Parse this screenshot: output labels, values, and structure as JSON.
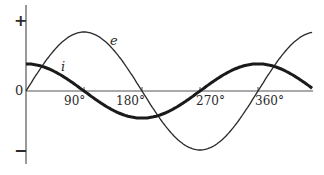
{
  "chart_data": {
    "type": "line",
    "title": "",
    "xlabel": "",
    "ylabel": "",
    "axis": {
      "y_positive_label": "+",
      "y_negative_label": "−",
      "origin_label": "0",
      "x_range_deg": [
        0,
        445
      ],
      "y_range": [
        -1.15,
        1.45
      ]
    },
    "x_ticks": [
      {
        "value": 90,
        "label": "90°"
      },
      {
        "value": 180,
        "label": "180°"
      },
      {
        "value": 270,
        "label": "270°"
      },
      {
        "value": 360,
        "label": "360°"
      }
    ],
    "series": [
      {
        "name": "e",
        "label": "e",
        "function": "sin",
        "amplitude": 1.0,
        "phase_deg": 0,
        "stroke_width": 1.3,
        "color": "#2a2a2a"
      },
      {
        "name": "i",
        "label": "i",
        "function": "cos",
        "amplitude": 0.46,
        "phase_deg": 90,
        "stroke_width": 3,
        "color": "#1a1a1a"
      }
    ],
    "grid": false,
    "legend": "inline labels on curves"
  }
}
